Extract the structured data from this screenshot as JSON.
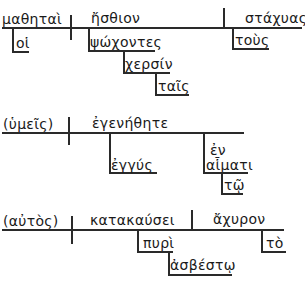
{
  "diagrams": [
    {
      "subject": "μαθηταὶ",
      "subject_modifier": "οἱ",
      "verb": "ἤσθιον",
      "object": "στάχυας",
      "object_modifier": "τοὺς",
      "participle": "ψώχοντες",
      "participle_modifier": "χερσίν",
      "participle_modifier_article": "ταῖς"
    },
    {
      "subject": "(ὑμεῖς)",
      "verb": "ἐγενήθητε",
      "adverb": "ἐγγύς",
      "preposition": "ἐν",
      "prep_object": "αἷματι",
      "prep_object_article": "τῷ"
    },
    {
      "subject": "(αὐτὸς)",
      "verb": "κατακαύσει",
      "object": "ἄχυρον",
      "object_modifier": "τὸ",
      "instrument": "πυρὶ",
      "instrument_modifier": "ἀσβέστῳ"
    }
  ],
  "colors": {
    "ink": "#2a2a2a",
    "background": "#ffffff"
  }
}
